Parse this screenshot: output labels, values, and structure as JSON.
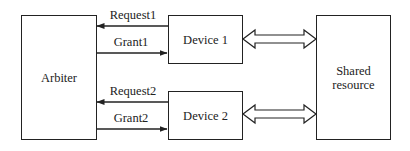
{
  "diagram": {
    "type": "block-diagram",
    "title": "",
    "nodes": [
      {
        "id": "arbiter",
        "label": "Arbiter"
      },
      {
        "id": "device1",
        "label": "Device 1"
      },
      {
        "id": "device2",
        "label": "Device 2"
      },
      {
        "id": "shared",
        "label": "Shared resource",
        "lines": [
          "Shared",
          "resource"
        ]
      }
    ],
    "edges": [
      {
        "from": "device1",
        "to": "arbiter",
        "label": "Request1",
        "style": "single-arrow"
      },
      {
        "from": "arbiter",
        "to": "device1",
        "label": "Grant1",
        "style": "single-arrow"
      },
      {
        "from": "device2",
        "to": "arbiter",
        "label": "Request2",
        "style": "single-arrow"
      },
      {
        "from": "arbiter",
        "to": "device2",
        "label": "Grant2",
        "style": "single-arrow"
      },
      {
        "from": "device1",
        "to": "shared",
        "label": "",
        "style": "double-hollow-arrow"
      },
      {
        "from": "device2",
        "to": "shared",
        "label": "",
        "style": "double-hollow-arrow"
      }
    ]
  },
  "labels": {
    "arbiter": "Arbiter",
    "device1": "Device 1",
    "device2": "Device 2",
    "shared_line1": "Shared",
    "shared_line2": "resource",
    "request1": "Request1",
    "grant1": "Grant1",
    "request2": "Request2",
    "grant2": "Grant2"
  },
  "colors": {
    "stroke": "#222222",
    "background": "#ffffff"
  }
}
